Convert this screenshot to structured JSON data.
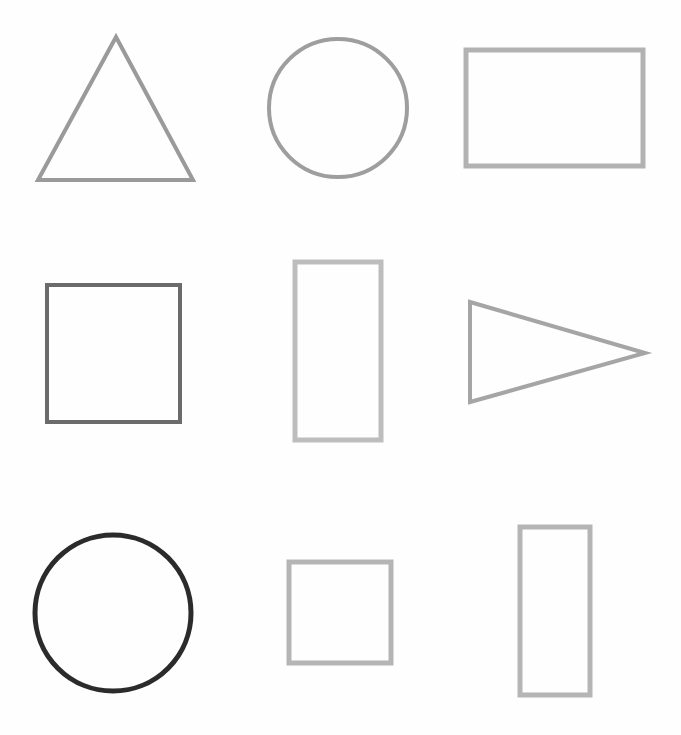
{
  "canvas": {
    "width": 681,
    "height": 735,
    "background": "#fefefe",
    "title": "Geometric Shapes Grid",
    "description": "Nine outlined geometric shapes arranged in a three by three grid on a white background, each drawn in a different shade of gray."
  },
  "palette": {
    "near_black": "#2b2b2b",
    "dark_gray": "#6b6b6b",
    "medium_gray": "#9a9a9a",
    "medium_gray_alt": "#a5a5a5",
    "light_gray": "#b2b2b2",
    "lighter_gray": "#bdbdbd",
    "background": "#fefefe"
  },
  "grid": {
    "rows": 3,
    "columns": 3,
    "count": 9
  },
  "shapes": [
    {
      "id": "shape-1",
      "name": "triangle",
      "kind": "triangle",
      "row": 1,
      "column": 1,
      "label": "Triangle",
      "color": "#9a9a9a",
      "stroke_width": 4,
      "fill": "none",
      "points": "116,37 193,180 38,180",
      "bbox": {
        "x": 38,
        "y": 37,
        "width": 155,
        "height": 143
      }
    },
    {
      "id": "shape-2",
      "name": "circle",
      "kind": "circle",
      "row": 1,
      "column": 2,
      "label": "Circle",
      "color": "#9e9e9e",
      "stroke_width": 4,
      "fill": "none",
      "cx": 338,
      "cy": 108,
      "r": 69,
      "bbox": {
        "x": 269,
        "y": 39,
        "width": 138,
        "height": 138
      }
    },
    {
      "id": "shape-3",
      "name": "rectangle-wide",
      "kind": "rectangle",
      "row": 1,
      "column": 3,
      "label": "Rectangle",
      "color": "#b2b2b2",
      "stroke_width": 5,
      "fill": "none",
      "bbox": {
        "x": 466,
        "y": 50,
        "width": 177,
        "height": 116
      }
    },
    {
      "id": "shape-4",
      "name": "square-dark",
      "kind": "square",
      "row": 2,
      "column": 1,
      "label": "Square",
      "color": "#6b6b6b",
      "stroke_width": 4,
      "fill": "none",
      "bbox": {
        "x": 47,
        "y": 285,
        "width": 133,
        "height": 137
      }
    },
    {
      "id": "shape-5",
      "name": "rectangle-tall-mid",
      "kind": "rectangle",
      "row": 2,
      "column": 2,
      "label": "Rectangle",
      "color": "#bdbdbd",
      "stroke_width": 5,
      "fill": "none",
      "bbox": {
        "x": 295,
        "y": 262,
        "width": 86,
        "height": 178
      }
    },
    {
      "id": "shape-6",
      "name": "triangle-right-pointing",
      "kind": "triangle",
      "row": 2,
      "column": 3,
      "label": "Triangle",
      "color": "#a5a5a5",
      "stroke_width": 4,
      "fill": "none",
      "points": "470,302 645,353 470,402",
      "bbox": {
        "x": 470,
        "y": 302,
        "width": 175,
        "height": 100
      }
    },
    {
      "id": "shape-7",
      "name": "circle-dark",
      "kind": "circle",
      "row": 3,
      "column": 1,
      "label": "Circle",
      "color": "#2b2b2b",
      "stroke_width": 5,
      "fill": "none",
      "cx": 113,
      "cy": 613,
      "r": 78,
      "bbox": {
        "x": 35,
        "y": 535,
        "width": 156,
        "height": 156
      }
    },
    {
      "id": "shape-8",
      "name": "square-small",
      "kind": "square",
      "row": 3,
      "column": 2,
      "label": "Square",
      "color": "#b5b5b5",
      "stroke_width": 5,
      "fill": "none",
      "bbox": {
        "x": 289,
        "y": 562,
        "width": 102,
        "height": 101
      }
    },
    {
      "id": "shape-9",
      "name": "rectangle-tall-right",
      "kind": "rectangle",
      "row": 3,
      "column": 3,
      "label": "Rectangle",
      "color": "#b5b5b5",
      "stroke_width": 5,
      "fill": "none",
      "bbox": {
        "x": 520,
        "y": 527,
        "width": 70,
        "height": 168
      }
    }
  ]
}
